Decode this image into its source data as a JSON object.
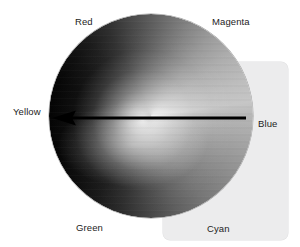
{
  "figure": {
    "type": "hue-circle-diagram",
    "background_color": "#ffffff",
    "panel": {
      "name": "background-panel",
      "fill_color": "#ececed",
      "corner_radius_px": 7,
      "x": 163,
      "y": 62,
      "width": 125,
      "height": 178
    },
    "wheel": {
      "name": "hue-wheel",
      "center_x": 151,
      "center_y": 116,
      "radius": 102,
      "rendering": "grayscale-luminance",
      "bright_side": "Yellow",
      "dark_side": "Blue"
    },
    "arrow": {
      "name": "hue-direction-arrow",
      "color": "#000000",
      "from_label": "Blue",
      "to_label": "Yellow",
      "from_x": 246,
      "from_y": 118,
      "to_x": 54,
      "to_y": 118,
      "head": "left"
    },
    "labels": [
      {
        "id": "red",
        "text": "Red",
        "x": 75,
        "y": 16,
        "angle_deg": 120
      },
      {
        "id": "magenta",
        "text": "Magenta",
        "x": 212,
        "y": 16,
        "angle_deg": 60
      },
      {
        "id": "yellow",
        "text": "Yellow",
        "x": 13,
        "y": 106,
        "angle_deg": 180
      },
      {
        "id": "blue",
        "text": "Blue",
        "x": 258,
        "y": 118,
        "angle_deg": 0
      },
      {
        "id": "green",
        "text": "Green",
        "x": 76,
        "y": 222,
        "angle_deg": 240
      },
      {
        "id": "cyan",
        "text": "Cyan",
        "x": 207,
        "y": 223,
        "angle_deg": 300
      }
    ]
  }
}
